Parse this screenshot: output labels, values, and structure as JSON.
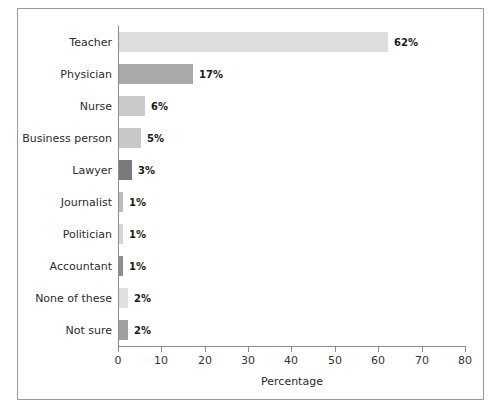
{
  "chart_data": {
    "type": "bar",
    "orientation": "horizontal",
    "title": "",
    "xlabel": "Percentage",
    "ylabel": "",
    "xlim": [
      0,
      80
    ],
    "xticks": [
      0,
      10,
      20,
      30,
      40,
      50,
      60,
      70,
      80
    ],
    "grid": false,
    "legend": false,
    "categories": [
      "Teacher",
      "Physician",
      "Nurse",
      "Business person",
      "Lawyer",
      "Journalist",
      "Politician",
      "Accountant",
      "None of these",
      "Not sure"
    ],
    "values": [
      62,
      17,
      6,
      5,
      3,
      1,
      1,
      1,
      2,
      2
    ],
    "value_labels": [
      "62%",
      "17%",
      "6%",
      "5%",
      "3%",
      "1%",
      "1%",
      "1%",
      "2%",
      "2%"
    ],
    "bar_colors": [
      "#dddddd",
      "#a9a9a9",
      "#cacaca",
      "#c8c8c8",
      "#7a7a7a",
      "#bdbdbd",
      "#d6d6d6",
      "#8f8f8f",
      "#e0e0e0",
      "#a0a0a0"
    ],
    "axis_color": "#8c8c8c",
    "frame_color": "#9a9a9a",
    "background": "#ffffff"
  }
}
